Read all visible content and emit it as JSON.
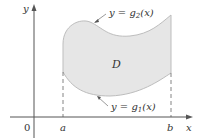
{
  "diagram": {
    "region_label": "D",
    "upper_curve": {
      "prefix": "y = g",
      "subscript": "2",
      "suffix": "(x)"
    },
    "lower_curve": {
      "prefix": "y = g",
      "subscript": "1",
      "suffix": "(x)"
    },
    "axes": {
      "x_label": "x",
      "y_label": "y",
      "origin_label": "0"
    },
    "ticks": {
      "a": "a",
      "b": "b"
    },
    "colors": {
      "fill": "#e6e6e6",
      "stroke": "#bdbdbd",
      "axis": "#555555",
      "text": "#333333"
    }
  }
}
